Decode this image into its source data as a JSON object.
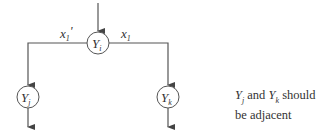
{
  "diagram": {
    "nodes": [
      {
        "id": "Yi",
        "label": "Y",
        "subscript": "i",
        "cx": 98,
        "cy": 43
      },
      {
        "id": "Yj",
        "label": "Y",
        "subscript": "j",
        "cx": 28,
        "cy": 98
      },
      {
        "id": "Yk",
        "label": "Y",
        "subscript": "k",
        "cx": 168,
        "cy": 98
      }
    ],
    "edges": [
      {
        "from": "input",
        "to": "Yi"
      },
      {
        "from": "Yi",
        "to": "Yj",
        "label": "x1'"
      },
      {
        "from": "Yi",
        "to": "Yk",
        "label": "x1"
      },
      {
        "from": "Yj",
        "to": "output"
      },
      {
        "from": "Yk",
        "to": "output"
      }
    ],
    "edge_labels": {
      "left_base": "x",
      "left_sub": "1",
      "left_prime": "'",
      "right_base": "x",
      "right_sub": "1"
    },
    "node_labels": {
      "yi_base": "Y",
      "yi_sub": "i",
      "yj_base": "Y",
      "yj_sub": "j",
      "yk_base": "Y",
      "yk_sub": "k"
    },
    "note": {
      "y1": "Y",
      "y1_sub": "j",
      "and": " and ",
      "y2": "Y",
      "y2_sub": "k",
      "rest": " should be adjacent"
    },
    "colors": {
      "stroke": "#555555",
      "text": "#333333"
    }
  }
}
